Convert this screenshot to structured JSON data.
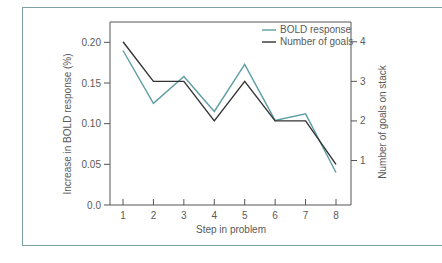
{
  "chart_data": {
    "type": "line",
    "title": "",
    "xlabel": "Step in problem",
    "ylabel": "Increase in BOLD response (%)",
    "y2label": "Number of goals on stack",
    "categories": [
      1,
      2,
      3,
      4,
      5,
      6,
      7,
      8
    ],
    "x_ticks": [
      "1",
      "2",
      "3",
      "4",
      "5",
      "6",
      "7",
      "8"
    ],
    "y_ticks": [
      "0.0",
      "0.05",
      "0.10",
      "0.15",
      "0.20"
    ],
    "y2_ticks": [
      "1",
      "2",
      "3",
      "4"
    ],
    "ylim": [
      0,
      0.225
    ],
    "y2lim": [
      -0.125,
      4.5
    ],
    "grid": false,
    "legend_position": "upper right",
    "series": [
      {
        "name": "BOLD response",
        "axis": "left",
        "color": "#5e9ea3",
        "values": [
          0.19,
          0.125,
          0.158,
          0.115,
          0.173,
          0.104,
          0.112,
          0.04
        ]
      },
      {
        "name": "Number of goals",
        "axis": "right",
        "color": "#333333",
        "values": [
          4,
          3,
          3,
          2,
          3,
          2,
          2,
          0.9
        ]
      }
    ]
  },
  "legend": {
    "items": [
      {
        "label": "BOLD response",
        "color": "#5e9ea3"
      },
      {
        "label": "Number of goals",
        "color": "#333333"
      }
    ]
  },
  "colors": {
    "frame": "#7ea2a6",
    "axis": "#555555",
    "text": "#5a5a5a"
  }
}
